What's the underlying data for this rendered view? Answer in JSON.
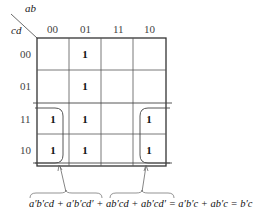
{
  "kmap": {
    "col_var": "ab",
    "row_var": "cd",
    "col_headers": [
      "00",
      "01",
      "11",
      "10"
    ],
    "row_headers": [
      "00",
      "01",
      "11",
      "10"
    ],
    "cells": [
      [
        "",
        "1",
        "",
        ""
      ],
      [
        "",
        "1",
        "",
        ""
      ],
      [
        "1",
        "1",
        "",
        "1"
      ],
      [
        "1",
        "1",
        "",
        "1"
      ]
    ]
  },
  "equation": "a′b′cd + a′b′cd′ + ab′cd + ab′cd′ = a′b′c + ab′c = b′c"
}
